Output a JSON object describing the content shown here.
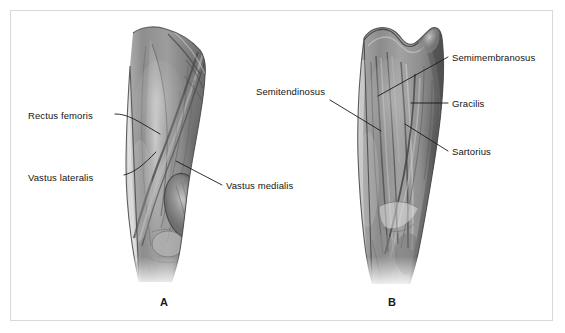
{
  "figure": {
    "caption_letters": {
      "panel_a": "A",
      "panel_b": "B"
    },
    "border_color": "#d9d9d9",
    "background_color": "#ffffff",
    "text_color": "#141414",
    "leader_line_color": "#1a1a1a"
  },
  "panels": [
    {
      "id": "panel-a",
      "letter": "A",
      "view": "anterior-thigh",
      "labels": [
        {
          "key": "rectus_femoris",
          "text": "Rectus femoris"
        },
        {
          "key": "vastus_lateralis",
          "text": "Vastus lateralis"
        },
        {
          "key": "vastus_medialis",
          "text": "Vastus medialis"
        }
      ]
    },
    {
      "id": "panel-b",
      "letter": "B",
      "view": "posterior-thigh",
      "labels": [
        {
          "key": "semitendinosus",
          "text": "Semitendinosus"
        },
        {
          "key": "semimembranosus",
          "text": "Semimembranosus"
        },
        {
          "key": "gracilis",
          "text": "Gracilis"
        },
        {
          "key": "sartorius",
          "text": "Sartorius"
        }
      ]
    }
  ],
  "labels": {
    "rectus_femoris": "Rectus femoris",
    "vastus_lateralis": "Vastus lateralis",
    "vastus_medialis": "Vastus medialis",
    "semitendinosus": "Semitendinosus",
    "semimembranosus": "Semimembranosus",
    "gracilis": "Gracilis",
    "sartorius": "Sartorius"
  },
  "illustration": {
    "style": "grayscale-medical-airbrush",
    "tone_light": "#cfcfcf",
    "tone_mid": "#9a9a9a",
    "tone_dark": "#5e5e5e",
    "tone_deep": "#3c3c3c"
  }
}
